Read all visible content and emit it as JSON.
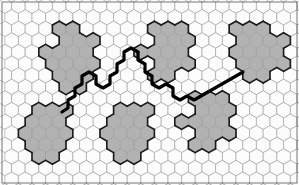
{
  "figure": {
    "title": "",
    "caption": "",
    "width": 299,
    "height": 185,
    "background_color": "#ffffff",
    "frame": {
      "stroke": "#555555",
      "stroke_width": 0.8,
      "x": 2,
      "y": 2,
      "w": 295,
      "h": 181
    }
  },
  "chart_data": {
    "type": "heatmap",
    "title": "",
    "subtitle": "",
    "xlabel": "",
    "ylabel": "",
    "grid": true,
    "legend": "none",
    "lattice": {
      "cell_shape": "hexagon",
      "orientation": "pointy-top",
      "cell_width": 13.6,
      "cell_height": 15.4,
      "row_step": 11.6,
      "columns": 23,
      "rows": 17,
      "origin_x": -2,
      "origin_y": -2,
      "cell_stroke": "#9a9a9a",
      "cell_stroke_width": 0.6,
      "empty_fill": "#fcfcfc"
    },
    "states": {
      "empty": {
        "label": "empty",
        "fill": "#fcfcfc"
      },
      "cluster": {
        "label": "cluster",
        "fill": "#b2b2b2"
      }
    },
    "cluster_outline": {
      "stroke": "#1a1a1a",
      "stroke_width": 1.6
    },
    "path": {
      "stroke": "#000000",
      "stroke_width": 3.2,
      "label": "percolation-path"
    },
    "clusters": [
      {
        "name": "cluster-top-left",
        "fill": "#b2b2b2",
        "centroid": [
          74,
          55
        ],
        "cells": [
          [
            4,
            2
          ],
          [
            5,
            2
          ],
          [
            4,
            3
          ],
          [
            5,
            3
          ],
          [
            6,
            3
          ],
          [
            3,
            4
          ],
          [
            4,
            4
          ],
          [
            5,
            4
          ],
          [
            6,
            4
          ],
          [
            3,
            5
          ],
          [
            4,
            5
          ],
          [
            5,
            5
          ],
          [
            6,
            5
          ],
          [
            4,
            6
          ],
          [
            5,
            6
          ],
          [
            6,
            6
          ],
          [
            4,
            7
          ],
          [
            5,
            7
          ]
        ]
      },
      {
        "name": "cluster-top-mid",
        "fill": "#b2b2b2",
        "centroid": [
          170,
          52
        ],
        "cells": [
          [
            11,
            2
          ],
          [
            12,
            2
          ],
          [
            13,
            2
          ],
          [
            11,
            3
          ],
          [
            12,
            3
          ],
          [
            13,
            3
          ],
          [
            10,
            4
          ],
          [
            11,
            4
          ],
          [
            12,
            4
          ],
          [
            13,
            4
          ],
          [
            11,
            5
          ],
          [
            12,
            5
          ],
          [
            13,
            5
          ],
          [
            11,
            6
          ],
          [
            12,
            6
          ]
        ]
      },
      {
        "name": "cluster-top-right",
        "fill": "#b2b2b2",
        "centroid": [
          255,
          50
        ],
        "cells": [
          [
            17,
            2
          ],
          [
            18,
            2
          ],
          [
            19,
            2
          ],
          [
            17,
            3
          ],
          [
            18,
            3
          ],
          [
            19,
            3
          ],
          [
            20,
            3
          ],
          [
            17,
            4
          ],
          [
            18,
            4
          ],
          [
            19,
            4
          ],
          [
            20,
            4
          ],
          [
            17,
            5
          ],
          [
            18,
            5
          ],
          [
            19,
            5
          ],
          [
            20,
            5
          ],
          [
            18,
            6
          ],
          [
            19,
            6
          ]
        ]
      },
      {
        "name": "cluster-bottom-left",
        "fill": "#b2b2b2",
        "centroid": [
          48,
          135
        ],
        "cells": [
          [
            2,
            9
          ],
          [
            3,
            9
          ],
          [
            4,
            9
          ],
          [
            2,
            10
          ],
          [
            3,
            10
          ],
          [
            4,
            10
          ],
          [
            1,
            11
          ],
          [
            2,
            11
          ],
          [
            3,
            11
          ],
          [
            4,
            11
          ],
          [
            2,
            12
          ],
          [
            3,
            12
          ],
          [
            4,
            12
          ],
          [
            2,
            13
          ],
          [
            3,
            13
          ]
        ]
      },
      {
        "name": "cluster-bottom-mid",
        "fill": "#b2b2b2",
        "centroid": [
          132,
          138
        ],
        "cells": [
          [
            8,
            9
          ],
          [
            9,
            9
          ],
          [
            10,
            9
          ],
          [
            8,
            10
          ],
          [
            9,
            10
          ],
          [
            10,
            10
          ],
          [
            7,
            11
          ],
          [
            8,
            11
          ],
          [
            9,
            11
          ],
          [
            10,
            11
          ],
          [
            8,
            12
          ],
          [
            9,
            12
          ],
          [
            10,
            12
          ],
          [
            8,
            13
          ],
          [
            9,
            13
          ]
        ]
      },
      {
        "name": "cluster-bottom-right",
        "fill": "#b2b2b2",
        "centroid": [
          215,
          130
        ],
        "cells": [
          [
            14,
            8
          ],
          [
            15,
            8
          ],
          [
            16,
            8
          ],
          [
            14,
            9
          ],
          [
            15,
            9
          ],
          [
            16,
            9
          ],
          [
            13,
            10
          ],
          [
            14,
            10
          ],
          [
            15,
            10
          ],
          [
            16,
            10
          ],
          [
            14,
            11
          ],
          [
            15,
            11
          ],
          [
            16,
            11
          ],
          [
            14,
            12
          ],
          [
            15,
            12
          ]
        ]
      }
    ],
    "paths": [
      {
        "name": "path-left-diagonal",
        "points": "62,112 68,108 68,100 75,96 75,88 82,84 82,76 89,72 96,76 96,84 103,88 110,84 110,76 117,72 117,64 124,60 124,52 131,48 138,52"
      },
      {
        "name": "path-center-descending",
        "points": "138,52 138,60 145,64 145,72 152,76 152,84 159,88 166,84 173,88 173,96 180,100 187,96 194,100 201,96 208,92 215,88 222,84 229,80 236,76 243,72"
      }
    ]
  }
}
